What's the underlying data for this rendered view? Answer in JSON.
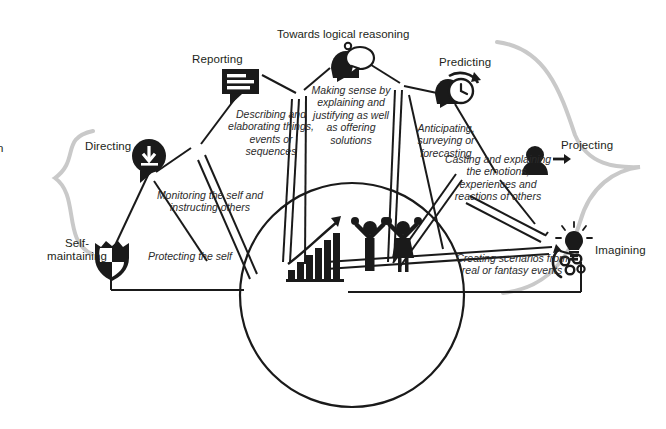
{
  "figure": {
    "heading": "Towards logical reasoning",
    "left_cut_text": "n",
    "background_color": "#ffffff",
    "ink_color": "#1a1a1a",
    "brace_color": "#c9c9c9"
  },
  "center": {
    "icons": [
      {
        "name": "growth-bar-chart-icon",
        "label": "growth bar chart with rising arrow"
      },
      {
        "name": "two-people-celebrating-icon",
        "label": "two people with raised arms"
      }
    ]
  },
  "spokes": [
    {
      "key": "self-maintaining",
      "label": "Self-\nmaintaining",
      "label_line1": "Self-",
      "label_line2": "maintaining",
      "description": "Protecting the self",
      "icon": "shield-icon"
    },
    {
      "key": "directing",
      "label": "Directing",
      "description": "Monitoring the self and instructing others",
      "icon": "speech-bubble-down-arrow-icon"
    },
    {
      "key": "reporting",
      "label": "Reporting",
      "description": "Describing and elaborating things, events or sequences",
      "icon": "speech-bubble-lines-icon"
    },
    {
      "key": "explaining",
      "label": "",
      "description": "Making sense by explaining and justifying as well as offering solutions",
      "icon": "head-speech-bubble-icon"
    },
    {
      "key": "predicting",
      "label": "Predicting",
      "description": "Anticipating, surveying or forecasting",
      "icon": "head-clock-icon"
    },
    {
      "key": "projecting",
      "label": "Projecting",
      "description": "Casting and explaining the emotions, experiences and reactions of others",
      "icon": "person-arrow-icon"
    },
    {
      "key": "imagining",
      "label": "Imagining",
      "description": "Creating scenarios from real or fantasy events",
      "icon": "lightbulb-gears-icon"
    }
  ]
}
